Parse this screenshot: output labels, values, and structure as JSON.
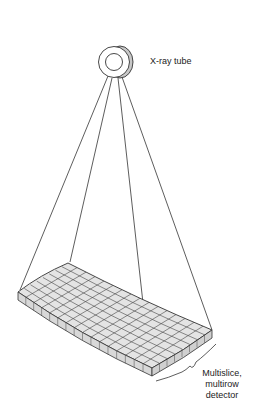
{
  "diagram": {
    "components": {
      "xray_tube": {
        "label": "X-ray tube"
      },
      "detector": {
        "label_lines": [
          "Multislice,",
          "multirow",
          "detector"
        ]
      }
    },
    "colors": {
      "line": "#333333",
      "detector_fill": "#e4e4e4",
      "detector_side": "#d0d0d0",
      "tube_rim": "#c8c8c8"
    },
    "grid": {
      "columns": 16,
      "rows": 8
    }
  }
}
